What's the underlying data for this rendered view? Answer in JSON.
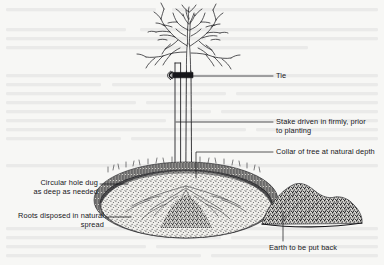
{
  "figure": {
    "type": "line-drawing",
    "background_color": "#f7f7f5",
    "ink_color": "#16161a",
    "labels": [
      {
        "id": "tie",
        "text": "Tie",
        "x": 276,
        "y": 72,
        "align": "left",
        "leader": {
          "type": "horizontal",
          "x1": 178,
          "y1": 76,
          "x2": 273,
          "y2": 76
        }
      },
      {
        "id": "stake",
        "text": "Stake driven in firmly, prior\nto planting",
        "x": 276,
        "y": 118,
        "align": "left",
        "leader": {
          "type": "horizontal",
          "x1": 176,
          "y1": 122,
          "x2": 273,
          "y2": 122
        }
      },
      {
        "id": "collar",
        "text": "Collar of tree at natural depth",
        "x": 276,
        "y": 148,
        "align": "left",
        "leader": {
          "type": "elbow-down",
          "x1": 196,
          "y1": 178,
          "x2": 196,
          "y2": 152,
          "x3": 273,
          "y3": 152
        }
      },
      {
        "id": "circular-hole",
        "text": "Circular hole dug\nas deep as needed",
        "x": 20,
        "y": 179,
        "align": "right",
        "leader": {
          "type": "horizontal",
          "x1": 100,
          "y1": 184,
          "x2": 128,
          "y2": 184
        }
      },
      {
        "id": "roots",
        "text": "Roots disposed in natural\nspread",
        "x": 5,
        "y": 212,
        "align": "right",
        "leader": {
          "type": "horizontal",
          "x1": 106,
          "y1": 217,
          "x2": 131,
          "y2": 217
        }
      },
      {
        "id": "earth",
        "text": "Earth to be put back",
        "x": 269,
        "y": 244,
        "align": "left",
        "leader": {
          "type": "vertical",
          "x1": 283,
          "y1": 212,
          "x2": 283,
          "y2": 241
        }
      }
    ],
    "elements": {
      "tree": "bare-branched deciduous sapling",
      "stake": "vertical wooden post left of trunk",
      "tie": "dark band joining stake to trunk",
      "hole": "elliptical planting pit with dark rim and stippled soil",
      "earth_pile": "irregular stippled mound of excavated soil at right"
    }
  }
}
